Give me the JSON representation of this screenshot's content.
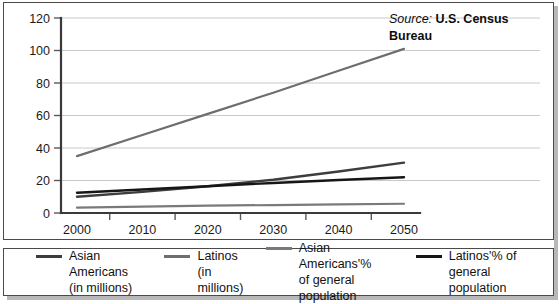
{
  "source": {
    "label": "Source:",
    "name": "U.S. Census Bureau"
  },
  "chart_data": {
    "type": "line",
    "title": "",
    "xlabel": "",
    "ylabel": "",
    "x": [
      2000,
      2010,
      2020,
      2030,
      2040,
      2050
    ],
    "xlim": [
      1995,
      2055
    ],
    "ylim": [
      0,
      120
    ],
    "yticks": [
      0,
      20,
      40,
      60,
      80,
      100,
      120
    ],
    "xticks": [
      2000,
      2010,
      2020,
      2030,
      2040,
      2050
    ],
    "grid": true,
    "legend_position": "below",
    "series": [
      {
        "name": "Asian Americans (in millions)",
        "legend_line1": "Asian Americans",
        "legend_line2": "(in millions)",
        "color": "#3d3d3d",
        "width": 2.4,
        "values": [
          10,
          13,
          16.5,
          20.5,
          25.5,
          31
        ]
      },
      {
        "name": "Latinos (in millions)",
        "legend_line1": "Latinos",
        "legend_line2": "(in millions)",
        "color": "#6e6e6e",
        "width": 2.2,
        "values": [
          35,
          48,
          61,
          74,
          87.5,
          101
        ]
      },
      {
        "name": "Asian Americans'% of general population",
        "legend_line1": "Asian Americans'%",
        "legend_line2": "of general population",
        "color": "#7a7a7a",
        "width": 2.2,
        "values": [
          3.3,
          3.9,
          4.5,
          4.9,
          5.3,
          5.7
        ]
      },
      {
        "name": "Latinos'% of general population",
        "legend_line1": "Latinos'% of",
        "legend_line2": "general population",
        "color": "#161616",
        "width": 2.4,
        "values": [
          12.5,
          14.5,
          16.5,
          18.5,
          20.3,
          22
        ]
      }
    ]
  }
}
